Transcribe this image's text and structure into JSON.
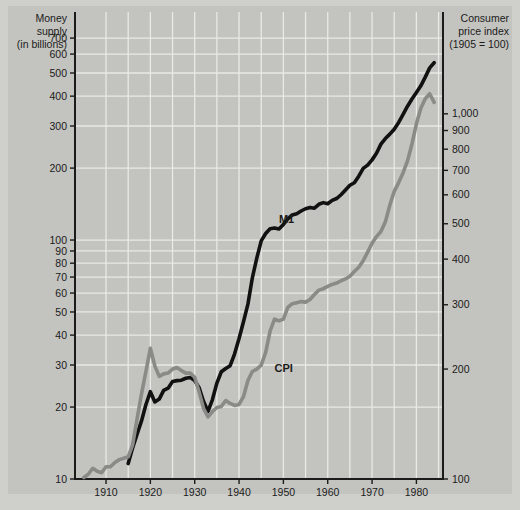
{
  "chart_data": {
    "type": "line",
    "title": "",
    "xlabel": "",
    "left_axis": {
      "title_lines": [
        "Money",
        "supply",
        "(in billions)"
      ],
      "scale": "log",
      "ticks": [
        10,
        20,
        30,
        40,
        50,
        60,
        70,
        80,
        90,
        100,
        200,
        300,
        400,
        500,
        600,
        700
      ],
      "tick_labels": [
        "10",
        "20",
        "30",
        "40",
        "50",
        "60",
        "70",
        "80",
        "90",
        "100",
        "200",
        "300",
        "400",
        "500",
        "600",
        "700"
      ],
      "range": [
        10,
        900
      ]
    },
    "right_axis": {
      "title_lines": [
        "Consumer",
        "price index",
        "(1905 = 100)"
      ],
      "scale": "log",
      "ticks": [
        100,
        200,
        300,
        400,
        500,
        600,
        700,
        800,
        900,
        1000
      ],
      "tick_labels": [
        "100",
        "200",
        "300",
        "400",
        "500",
        "600",
        "700",
        "800",
        "900",
        "1,000"
      ],
      "range": [
        100,
        1900
      ]
    },
    "x": {
      "range": [
        1903,
        1986
      ],
      "tick_labels": [
        "1910",
        "1920",
        "1930",
        "1940",
        "1950",
        "1960",
        "1970",
        "1980"
      ],
      "ticks": [
        1910,
        1920,
        1930,
        1940,
        1950,
        1960,
        1970,
        1980
      ],
      "gridline_years": [
        1910,
        1915,
        1920,
        1925,
        1930,
        1935,
        1940,
        1945,
        1950,
        1955,
        1960,
        1965,
        1970,
        1975,
        1980,
        1985
      ]
    },
    "grid": true,
    "legend_position": "inline-annotations",
    "series": [
      {
        "name": "M1",
        "axis": "left",
        "color": "#111111",
        "label_point": {
          "year": 1949,
          "value": 118
        },
        "points": [
          [
            1915,
            11.6
          ],
          [
            1916,
            13.5
          ],
          [
            1917,
            15.4
          ],
          [
            1918,
            17.5
          ],
          [
            1919,
            20.5
          ],
          [
            1920,
            23.2
          ],
          [
            1921,
            21.0
          ],
          [
            1922,
            21.6
          ],
          [
            1923,
            23.5
          ],
          [
            1924,
            24.0
          ],
          [
            1925,
            25.6
          ],
          [
            1926,
            25.8
          ],
          [
            1927,
            25.9
          ],
          [
            1928,
            26.4
          ],
          [
            1929,
            26.6
          ],
          [
            1930,
            25.8
          ],
          [
            1931,
            24.1
          ],
          [
            1932,
            21.1
          ],
          [
            1933,
            19.2
          ],
          [
            1934,
            21.5
          ],
          [
            1935,
            25.2
          ],
          [
            1936,
            28.1
          ],
          [
            1937,
            29.0
          ],
          [
            1938,
            29.8
          ],
          [
            1939,
            33.4
          ],
          [
            1940,
            38.7
          ],
          [
            1941,
            45.5
          ],
          [
            1942,
            53.9
          ],
          [
            1943,
            69.5
          ],
          [
            1944,
            84.0
          ],
          [
            1945,
            99.2
          ],
          [
            1946,
            106.5
          ],
          [
            1947,
            111.5
          ],
          [
            1948,
            112.3
          ],
          [
            1949,
            111.2
          ],
          [
            1950,
            116.2
          ],
          [
            1951,
            122.7
          ],
          [
            1952,
            127.4
          ],
          [
            1953,
            128.8
          ],
          [
            1954,
            132.3
          ],
          [
            1955,
            135.2
          ],
          [
            1956,
            136.9
          ],
          [
            1957,
            135.9
          ],
          [
            1958,
            141.1
          ],
          [
            1959,
            143.4
          ],
          [
            1960,
            141.8
          ],
          [
            1961,
            146.5
          ],
          [
            1962,
            149.2
          ],
          [
            1963,
            154.7
          ],
          [
            1964,
            161.9
          ],
          [
            1965,
            169.5
          ],
          [
            1966,
            173.7
          ],
          [
            1967,
            185.1
          ],
          [
            1968,
            199.4
          ],
          [
            1969,
            205.8
          ],
          [
            1970,
            216.5
          ],
          [
            1971,
            230.6
          ],
          [
            1972,
            252.0
          ],
          [
            1973,
            265.8
          ],
          [
            1974,
            277.4
          ],
          [
            1975,
            291.0
          ],
          [
            1976,
            310.4
          ],
          [
            1977,
            335.5
          ],
          [
            1978,
            363.2
          ],
          [
            1979,
            389.0
          ],
          [
            1980,
            414.5
          ],
          [
            1981,
            441.9
          ],
          [
            1982,
            480.5
          ],
          [
            1983,
            525.4
          ],
          [
            1984,
            552.0
          ]
        ]
      },
      {
        "name": "CPI",
        "axis": "right",
        "color": "#8a8a86",
        "label_point": {
          "year": 1948,
          "value": 196
        },
        "points": [
          [
            1905,
            101
          ],
          [
            1906,
            103
          ],
          [
            1907,
            107
          ],
          [
            1908,
            105
          ],
          [
            1909,
            104
          ],
          [
            1910,
            108
          ],
          [
            1911,
            108
          ],
          [
            1912,
            111
          ],
          [
            1913,
            113
          ],
          [
            1914,
            114
          ],
          [
            1915,
            115
          ],
          [
            1916,
            124
          ],
          [
            1917,
            146
          ],
          [
            1918,
            171
          ],
          [
            1919,
            197
          ],
          [
            1920,
            228
          ],
          [
            1921,
            204
          ],
          [
            1922,
            191
          ],
          [
            1923,
            194
          ],
          [
            1924,
            195
          ],
          [
            1925,
            200
          ],
          [
            1926,
            202
          ],
          [
            1927,
            198
          ],
          [
            1928,
            195
          ],
          [
            1929,
            195
          ],
          [
            1930,
            190
          ],
          [
            1931,
            173
          ],
          [
            1932,
            156
          ],
          [
            1933,
            148
          ],
          [
            1934,
            153
          ],
          [
            1935,
            157
          ],
          [
            1936,
            158
          ],
          [
            1937,
            164
          ],
          [
            1938,
            161
          ],
          [
            1939,
            159
          ],
          [
            1940,
            160
          ],
          [
            1941,
            168
          ],
          [
            1942,
            186
          ],
          [
            1943,
            197
          ],
          [
            1944,
            200
          ],
          [
            1945,
            205
          ],
          [
            1946,
            222
          ],
          [
            1947,
            254
          ],
          [
            1948,
            274
          ],
          [
            1949,
            271
          ],
          [
            1950,
            274
          ],
          [
            1951,
            295
          ],
          [
            1952,
            302
          ],
          [
            1953,
            304
          ],
          [
            1954,
            306
          ],
          [
            1955,
            305
          ],
          [
            1956,
            310
          ],
          [
            1957,
            320
          ],
          [
            1958,
            329
          ],
          [
            1959,
            332
          ],
          [
            1960,
            337
          ],
          [
            1961,
            341
          ],
          [
            1962,
            344
          ],
          [
            1963,
            349
          ],
          [
            1964,
            353
          ],
          [
            1965,
            359
          ],
          [
            1966,
            370
          ],
          [
            1967,
            380
          ],
          [
            1968,
            396
          ],
          [
            1969,
            418
          ],
          [
            1970,
            442
          ],
          [
            1971,
            461
          ],
          [
            1972,
            476
          ],
          [
            1973,
            506
          ],
          [
            1974,
            562
          ],
          [
            1975,
            613
          ],
          [
            1976,
            648
          ],
          [
            1977,
            690
          ],
          [
            1978,
            743
          ],
          [
            1979,
            827
          ],
          [
            1980,
            939
          ],
          [
            1981,
            1036
          ],
          [
            1982,
            1100
          ],
          [
            1983,
            1135
          ],
          [
            1984,
            1075
          ]
        ]
      }
    ]
  }
}
